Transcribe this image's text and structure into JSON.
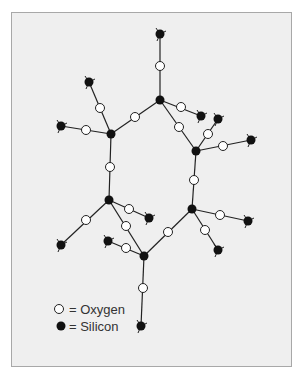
{
  "figure": {
    "colors": {
      "background": "#efefef",
      "frame": "#a8a8a8",
      "bond": "#222222",
      "silicon": "#111111",
      "oxygen_fill": "#ffffff",
      "oxygen_stroke": "#222222"
    }
  },
  "legend": {
    "oxygen_label": "= Oxygen",
    "silicon_label": "= Silicon"
  },
  "atoms": {
    "silicon": [
      [
        160,
        100
      ],
      [
        111,
        134
      ],
      [
        201,
        116
      ],
      [
        196,
        151
      ],
      [
        109,
        200
      ],
      [
        192,
        209
      ],
      [
        144,
        256
      ],
      [
        160,
        34
      ],
      [
        89,
        82
      ],
      [
        61,
        126
      ],
      [
        218,
        119
      ],
      [
        251,
        140
      ],
      [
        149,
        218
      ],
      [
        61,
        245
      ],
      [
        108,
        241
      ],
      [
        248,
        221
      ],
      [
        218,
        250
      ],
      [
        141,
        326
      ]
    ],
    "oxygen": [
      [
        160,
        66
      ],
      [
        100,
        108
      ],
      [
        86,
        130
      ],
      [
        135,
        117
      ],
      [
        181,
        107
      ],
      [
        179,
        127
      ],
      [
        208,
        134
      ],
      [
        223,
        146
      ],
      [
        194,
        180
      ],
      [
        110,
        167
      ],
      [
        129,
        209
      ],
      [
        86,
        220
      ],
      [
        126,
        226
      ],
      [
        126,
        248
      ],
      [
        168,
        232
      ],
      [
        220,
        215
      ],
      [
        205,
        230
      ],
      [
        143,
        288
      ]
    ],
    "bonds": [
      [
        160,
        34,
        160,
        100
      ],
      [
        160,
        100,
        111,
        134
      ],
      [
        160,
        100,
        201,
        116
      ],
      [
        160,
        100,
        196,
        151
      ],
      [
        89,
        82,
        111,
        134
      ],
      [
        61,
        126,
        111,
        134
      ],
      [
        111,
        134,
        109,
        200
      ],
      [
        196,
        151,
        218,
        119
      ],
      [
        196,
        151,
        251,
        140
      ],
      [
        196,
        151,
        192,
        209
      ],
      [
        109,
        200,
        149,
        218
      ],
      [
        109,
        200,
        61,
        245
      ],
      [
        109,
        200,
        144,
        256
      ],
      [
        108,
        241,
        144,
        256
      ],
      [
        144,
        256,
        192,
        209
      ],
      [
        144,
        256,
        141,
        326
      ],
      [
        192,
        209,
        248,
        221
      ],
      [
        192,
        209,
        218,
        250
      ]
    ],
    "terminal_silicon": [
      [
        160,
        34
      ],
      [
        89,
        82
      ],
      [
        61,
        126
      ],
      [
        201,
        116
      ],
      [
        218,
        119
      ],
      [
        251,
        140
      ],
      [
        149,
        218
      ],
      [
        61,
        245
      ],
      [
        108,
        241
      ],
      [
        248,
        221
      ],
      [
        218,
        250
      ],
      [
        141,
        326
      ]
    ]
  }
}
